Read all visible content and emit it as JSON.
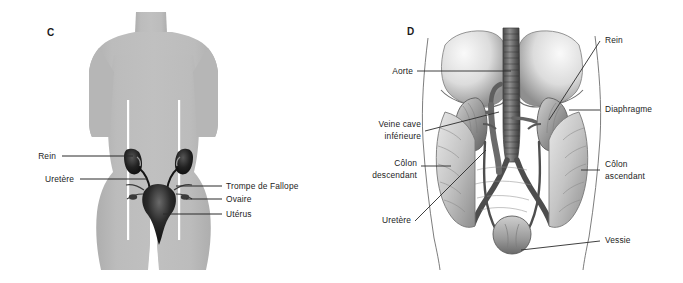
{
  "figure": {
    "background_color": "#ffffff",
    "text_color": "#1c1c1c",
    "leader_line_color": "#2b2b2b",
    "silhouette_color": "#b9b9b9",
    "silhouette_shadow_color": "#a8a8a8",
    "guide_line_color": "#ffffff",
    "organ_dark_color": "#1a1a1a",
    "illustration_ink_color": "#585858"
  },
  "panel_c": {
    "letter": "C",
    "description": "Silhouette frontale d'un corps feminin avec appareil urinaire et organes genitaux",
    "labels_left": [
      {
        "id": "rein",
        "text": "Rein"
      },
      {
        "id": "uretere",
        "text": "Uretère"
      }
    ],
    "labels_right": [
      {
        "id": "trompe-de-fallope",
        "text": "Trompe de Fallope"
      },
      {
        "id": "ovaire",
        "text": "Ovaire"
      },
      {
        "id": "uterus",
        "text": "Utérus"
      }
    ]
  },
  "panel_d": {
    "letter": "D",
    "description": "Dessin anatomique detaille de l'abdomen montrant reins, aorte, veine cave, colon et vessie",
    "labels_left": [
      {
        "id": "aorte",
        "text": "Aorte",
        "lines": [
          "Aorte"
        ]
      },
      {
        "id": "veine-cave-inferieure",
        "text": "Veine cave inférieure",
        "lines": [
          "Veine cave",
          "inférieure"
        ]
      },
      {
        "id": "colon-descendant",
        "text": "Côlon descendant",
        "lines": [
          "Côlon",
          "descendant"
        ]
      },
      {
        "id": "uretere",
        "text": "Uretère",
        "lines": [
          "Uretère"
        ]
      }
    ],
    "labels_right": [
      {
        "id": "rein",
        "text": "Rein",
        "lines": [
          "Rein"
        ]
      },
      {
        "id": "diaphragme",
        "text": "Diaphragme",
        "lines": [
          "Diaphragme"
        ]
      },
      {
        "id": "colon-ascendant",
        "text": "Côlon ascendant",
        "lines": [
          "Côlon",
          "ascendant"
        ]
      },
      {
        "id": "vessie",
        "text": "Vessie",
        "lines": [
          "Vessie"
        ]
      }
    ]
  }
}
